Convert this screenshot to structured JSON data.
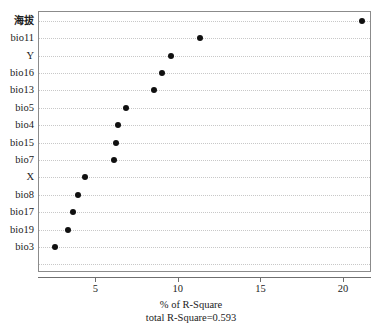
{
  "chart_data": {
    "type": "scatter",
    "subtype": "dot-plot",
    "orientation": "horizontal",
    "title": "",
    "xlabel": "% of R-Square",
    "sublabel": "total R-Square=0.593",
    "ylabel": "",
    "categories": [
      "海拔",
      "bio11",
      "Y",
      "bio16",
      "bio13",
      "bio5",
      "bio4",
      "bio15",
      "bio7",
      "X",
      "bio8",
      "bio17",
      "bio19",
      "bio3"
    ],
    "values": [
      21.1,
      11.3,
      9.5,
      9.0,
      8.5,
      6.8,
      6.3,
      6.2,
      6.1,
      4.3,
      3.9,
      3.6,
      3.3,
      2.5
    ],
    "xlim": [
      2.0,
      22.7
    ],
    "xticks": [
      5,
      10,
      15,
      20
    ],
    "xtick_labels": [
      "5",
      "10",
      "15",
      "20"
    ],
    "grid": true,
    "grid_axis": "y",
    "grid_style": "dotted",
    "legend": "none",
    "marker": {
      "shape": "circle",
      "color": "#101010",
      "size": 6
    },
    "total_r_square": 0.593,
    "n_rows": 15,
    "colors": {
      "background": "#ffffff",
      "frame": "#8b8b8b",
      "gridline": "#c8c8c8",
      "axis": "#6f6f6f",
      "text": "#1b1b1b"
    }
  }
}
